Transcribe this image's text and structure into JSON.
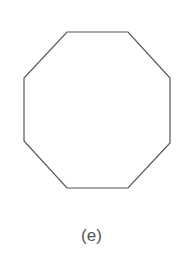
{
  "figure": {
    "shape": "octagon",
    "points": "67,32 128,32 170,78 170,143 128,188 67,188 24,141 24,78",
    "stroke": "#555555",
    "fill": "#ffffff",
    "label": "(e)"
  }
}
